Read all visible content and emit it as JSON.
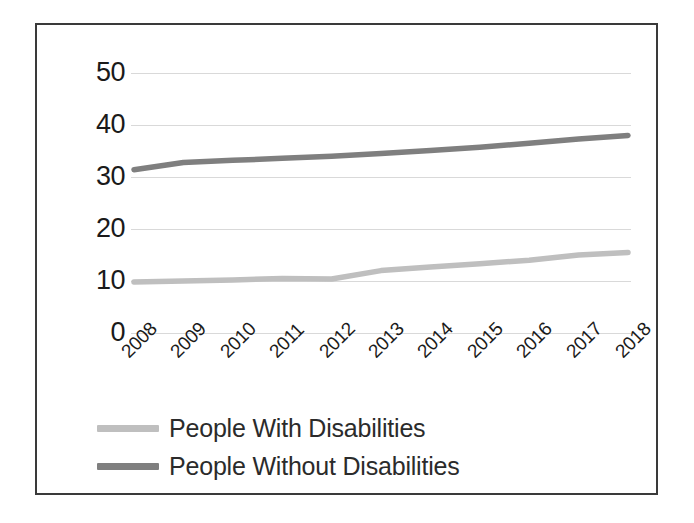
{
  "chart_data": {
    "type": "line",
    "title": "",
    "subtitle": "",
    "xlabel": "",
    "ylabel": "",
    "categories": [
      "2008",
      "2009",
      "2010",
      "2011",
      "2012",
      "2013",
      "2014",
      "2015",
      "2016",
      "2017",
      "2018"
    ],
    "series": [
      {
        "name": "People With Disabilities",
        "color": "#bfbfbf",
        "values": [
          9.8,
          10.0,
          10.2,
          10.5,
          10.4,
          12.0,
          12.7,
          13.3,
          14.0,
          15.0,
          15.5
        ]
      },
      {
        "name": "People Without Disabilities",
        "color": "#7f7f7f",
        "values": [
          31.4,
          32.8,
          33.2,
          33.6,
          34.0,
          34.5,
          35.1,
          35.7,
          36.5,
          37.3,
          38.0
        ]
      }
    ],
    "ylim": [
      0,
      50
    ],
    "yticks": [
      "0",
      "10",
      "20",
      "30",
      "40",
      "50"
    ],
    "grid": true,
    "grid_color": "#d9d9d9",
    "legend_position": "bottom",
    "xtick_rotation": -45,
    "frame_border_color": "#3a3a3a",
    "background": "#ffffff"
  },
  "legend": {
    "entries": [
      {
        "label": "People With Disabilities",
        "color": "#bfbfbf"
      },
      {
        "label": "People Without Disabilities",
        "color": "#7f7f7f"
      }
    ]
  }
}
